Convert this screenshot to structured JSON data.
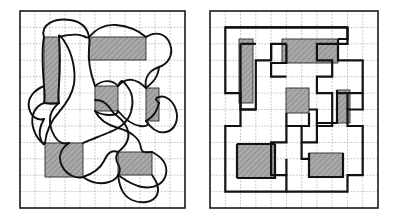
{
  "figure": {
    "title": "Curved closed tour versus its rectilinear grid-snapped equivalent",
    "caption": "",
    "background_color": "#ffffff",
    "width": 395,
    "height": 217
  },
  "style": {
    "frame_color": "#1a1a1a",
    "frame_width": 1.6,
    "grid_color": "#8d8d8d",
    "grid_width": 0.55,
    "grid_dash": "1.6 1.6",
    "path_color": "#111111",
    "curve_width": 1.9,
    "rect_path_width": 2.2,
    "obstacle_fill": "#a8a8a8",
    "obstacle_stroke": "#2b2b2b",
    "obstacle_stroke_width": 0.9,
    "obstacle_hatch_color": "#7d7d7d"
  },
  "panels": [
    {
      "id": "left-panel",
      "name": "curved-tour-panel",
      "label": "",
      "frame": {
        "x": 20,
        "y": 11,
        "width": 165,
        "height": 197
      },
      "grid": {
        "columns": 11,
        "rows": 12,
        "cell_width": 15.0,
        "cell_height": 16.42
      },
      "path_type": "curved",
      "obstacles": [
        {
          "name": "obstacle-tall-left",
          "x": 44,
          "y": 37,
          "width": 15,
          "height": 66
        },
        {
          "name": "obstacle-wide-top",
          "x": 89,
          "y": 37,
          "width": 57,
          "height": 23
        },
        {
          "name": "obstacle-center",
          "x": 95,
          "y": 86,
          "width": 23,
          "height": 25
        },
        {
          "name": "obstacle-right-mid",
          "x": 146,
          "y": 88,
          "width": 13,
          "height": 33
        },
        {
          "name": "obstacle-bottom-left",
          "x": 45,
          "y": 143,
          "width": 38,
          "height": 34
        },
        {
          "name": "obstacle-bottom-right",
          "x": 118,
          "y": 152,
          "width": 34,
          "height": 23
        }
      ]
    },
    {
      "id": "right-panel",
      "name": "rectilinear-tour-panel",
      "label": "",
      "frame": {
        "x": 210,
        "y": 11,
        "width": 168,
        "height": 197
      },
      "grid": {
        "columns": 11,
        "rows": 12,
        "cell_width": 15.27,
        "cell_height": 16.42
      },
      "path_type": "rectilinear",
      "obstacles": [
        {
          "name": "obstacle-tall-left",
          "x": 239,
          "y": 39,
          "width": 14,
          "height": 64
        },
        {
          "name": "obstacle-wide-top",
          "x": 282,
          "y": 39,
          "width": 56,
          "height": 24
        },
        {
          "name": "obstacle-center",
          "x": 286,
          "y": 88,
          "width": 23,
          "height": 25
        },
        {
          "name": "obstacle-right-mid",
          "x": 337,
          "y": 90,
          "width": 13,
          "height": 33
        },
        {
          "name": "obstacle-bottom-left",
          "x": 237,
          "y": 144,
          "width": 38,
          "height": 34
        },
        {
          "name": "obstacle-bottom-right",
          "x": 309,
          "y": 153,
          "width": 34,
          "height": 24
        }
      ]
    }
  ]
}
